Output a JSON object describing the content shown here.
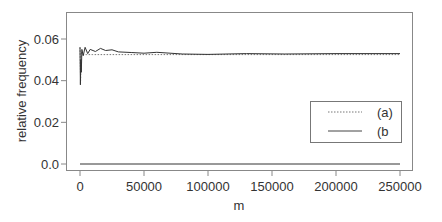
{
  "chart_data": {
    "type": "line",
    "title": "",
    "xlabel": "m",
    "ylabel": "relative frequency",
    "xlim": [
      -8000,
      258000
    ],
    "ylim": [
      -0.0015,
      0.0715
    ],
    "x_ticks": [
      0,
      50000,
      100000,
      150000,
      200000,
      250000
    ],
    "x_tick_labels": [
      "0",
      "50000",
      "100000",
      "150000",
      "200000",
      "250000"
    ],
    "y_ticks": [
      0.0,
      0.02,
      0.04,
      0.06
    ],
    "y_tick_labels": [
      "0.0",
      "0.02",
      "0.04",
      "0.06"
    ],
    "grid": false,
    "legend_position": "right-center",
    "series": [
      {
        "name": "(a)",
        "style": "dotted",
        "x": [
          0,
          500,
          1000,
          2000,
          5000,
          10000,
          20000,
          50000,
          100000,
          150000,
          200000,
          250000
        ],
        "values": [
          0.056,
          0.04,
          0.054,
          0.0525,
          0.0525,
          0.0525,
          0.0525,
          0.0525,
          0.0525,
          0.0525,
          0.0525,
          0.0525
        ]
      },
      {
        "name": "(b",
        "style": "solid",
        "x": [
          0,
          300,
          600,
          1000,
          1500,
          2500,
          4000,
          6000,
          8000,
          12000,
          16000,
          20000,
          25000,
          30000,
          40000,
          50000,
          60000,
          80000,
          100000,
          130000,
          160000,
          200000,
          250000
        ],
        "values": [
          0.056,
          0.038,
          0.05,
          0.044,
          0.055,
          0.052,
          0.056,
          0.053,
          0.055,
          0.054,
          0.0555,
          0.0545,
          0.0548,
          0.0538,
          0.0535,
          0.0532,
          0.0536,
          0.0528,
          0.0526,
          0.053,
          0.0528,
          0.053,
          0.053
        ]
      },
      {
        "name": "baseline",
        "style": "solid",
        "x": [
          0,
          250000
        ],
        "values": [
          0.0,
          0.0
        ]
      }
    ],
    "legend": [
      {
        "label": "(a)",
        "style": "dotted"
      },
      {
        "label": "(b",
        "style": "solid"
      }
    ]
  },
  "colors": {
    "line": "#333333",
    "frame": "#888888",
    "text": "#333333"
  }
}
